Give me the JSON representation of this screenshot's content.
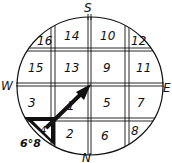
{
  "diagram": {
    "type": "compass-grid",
    "directions": {
      "north": "N",
      "south": "S",
      "east": "E",
      "west": "W"
    },
    "cells": [
      {
        "label": "16",
        "row": 0,
        "col": 0
      },
      {
        "label": "14",
        "row": 0,
        "col": 1
      },
      {
        "label": "10",
        "row": 0,
        "col": 2
      },
      {
        "label": "12",
        "row": 0,
        "col": 3
      },
      {
        "label": "15",
        "row": 1,
        "col": 0
      },
      {
        "label": "13",
        "row": 1,
        "col": 1
      },
      {
        "label": "9",
        "row": 1,
        "col": 2
      },
      {
        "label": "11",
        "row": 1,
        "col": 3
      },
      {
        "label": "3",
        "row": 2,
        "col": 0
      },
      {
        "label": "1",
        "row": 2,
        "col": 1
      },
      {
        "label": "5",
        "row": 2,
        "col": 2
      },
      {
        "label": "7",
        "row": 2,
        "col": 3
      },
      {
        "label": "4",
        "row": 3,
        "col": 0
      },
      {
        "label": "2",
        "row": 3,
        "col": 1
      },
      {
        "label": "6",
        "row": 3,
        "col": 2
      },
      {
        "label": "8",
        "row": 3,
        "col": 3
      }
    ],
    "annotation": "6°8",
    "colors": {
      "ink": "#111111",
      "background": "#ffffff"
    }
  }
}
